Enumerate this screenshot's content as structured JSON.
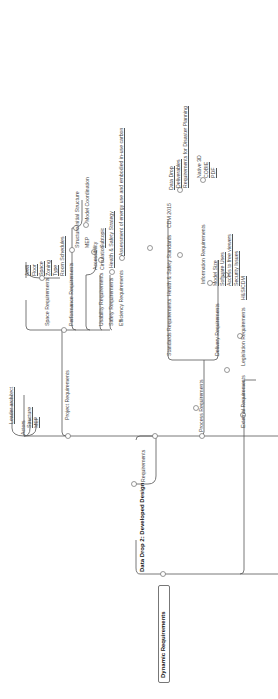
{
  "root": {
    "label": "Dynamic Requirements"
  },
  "stage": {
    "label": "Data Drop 2: Developed Design"
  },
  "branch_requirements": "Requirements",
  "actors": {
    "label": "Actors",
    "children": [
      "Leader architect",
      "Structure",
      "MEP"
    ]
  },
  "project_requirements": {
    "label": "Project Requirements",
    "space": {
      "label": "Space Requirements",
      "children": [
        "Area",
        "Floor",
        "Space",
        "Zoning",
        "Type",
        "Room Schedules"
      ]
    },
    "performance": {
      "label": "Performance Requirements",
      "structure": "Structure",
      "structure_child": "Initial Structure",
      "mep": "MEP",
      "mep_child": "Model Coordination"
    },
    "usability": {
      "label": "Usability Requirements",
      "accessibility": "Accessibility",
      "circulation": "Circulation",
      "circulation_child": "Subtopic"
    },
    "safety": {
      "label": "Safety Requirements",
      "child": "Health & Safety Strategy"
    },
    "efficiency": {
      "label": "Efficiency Requirements",
      "child": "Assessment of energy use and embodied in-use carbon"
    }
  },
  "process_requirements": {
    "label": "Process Requirements",
    "standards": {
      "label": "Standards Requirements",
      "hs": "Health & Safety Standards",
      "cdm": "CDM 2015",
      "children": [
        "Data Drop",
        "Deliverables",
        "Requirements for Disaster Planning"
      ]
    },
    "delivery": {
      "label": "Delivery Requirements",
      "info": "Information Requirements",
      "info_children": [
        "Native 3D",
        "COBIE",
        "PDF"
      ],
      "children": [
        "Model Size",
        "Software Uses",
        "Access to free viewers",
        "Security Issues"
      ]
    }
  },
  "external_requirements": {
    "label": "External Requirements",
    "legislation": "Legislation Requirements",
    "child": "H&S/CDM"
  },
  "colors": {
    "line": "#555555",
    "text": "#444444"
  }
}
